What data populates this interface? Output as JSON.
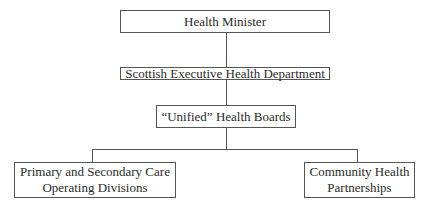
{
  "diagram": {
    "type": "org-chart",
    "nodes": [
      {
        "id": "health-minister",
        "label": "Health Minister"
      },
      {
        "id": "sehd",
        "label": "Scottish Executive Health Department"
      },
      {
        "id": "unified-boards",
        "label": "“Unified” Health Boards"
      },
      {
        "id": "operating-divisions",
        "label_line1": "Primary and Secondary Care",
        "label_line2": "Operating Divisions"
      },
      {
        "id": "chp",
        "label_line1": "Community Health",
        "label_line2": "Partnerships"
      }
    ],
    "edges": [
      [
        "health-minister",
        "sehd"
      ],
      [
        "sehd",
        "unified-boards"
      ],
      [
        "unified-boards",
        "operating-divisions"
      ],
      [
        "unified-boards",
        "chp"
      ]
    ]
  }
}
